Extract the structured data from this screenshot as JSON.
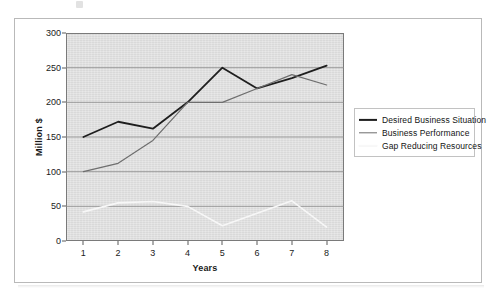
{
  "chart_data": {
    "type": "line",
    "title": "",
    "xlabel": "Years",
    "ylabel": "Million $",
    "categories": [
      "1",
      "2",
      "3",
      "4",
      "5",
      "6",
      "7",
      "8"
    ],
    "x": [
      1,
      2,
      3,
      4,
      5,
      6,
      7,
      8
    ],
    "xlim": [
      0.5,
      8.5
    ],
    "ylim": [
      0,
      300
    ],
    "y_ticks": [
      0,
      50,
      100,
      150,
      200,
      250,
      300
    ],
    "grid": true,
    "legend_position": "right",
    "plot_background": "#d9d9d9",
    "series": [
      {
        "name": "Desired Business Situation",
        "color": "#1e1e1e",
        "width": 1.8,
        "values": [
          150,
          172,
          162,
          200,
          250,
          220,
          235,
          253
        ]
      },
      {
        "name": "Business Performance",
        "color": "#6e6e6e",
        "width": 1.2,
        "values": [
          100,
          112,
          145,
          200,
          200,
          220,
          240,
          225
        ]
      },
      {
        "name": "Gap Reducing Resources",
        "color": "#f7f7f7",
        "width": 1.6,
        "values": [
          42,
          55,
          57,
          50,
          22,
          40,
          58,
          20
        ]
      }
    ]
  },
  "legend": {
    "items": [
      {
        "label": "Desired Business Situation",
        "color": "#1e1e1e"
      },
      {
        "label": "Business Performance",
        "color": "#6e6e6e"
      },
      {
        "label": "Gap Reducing Resources",
        "color": "#fbfbfb"
      }
    ]
  }
}
